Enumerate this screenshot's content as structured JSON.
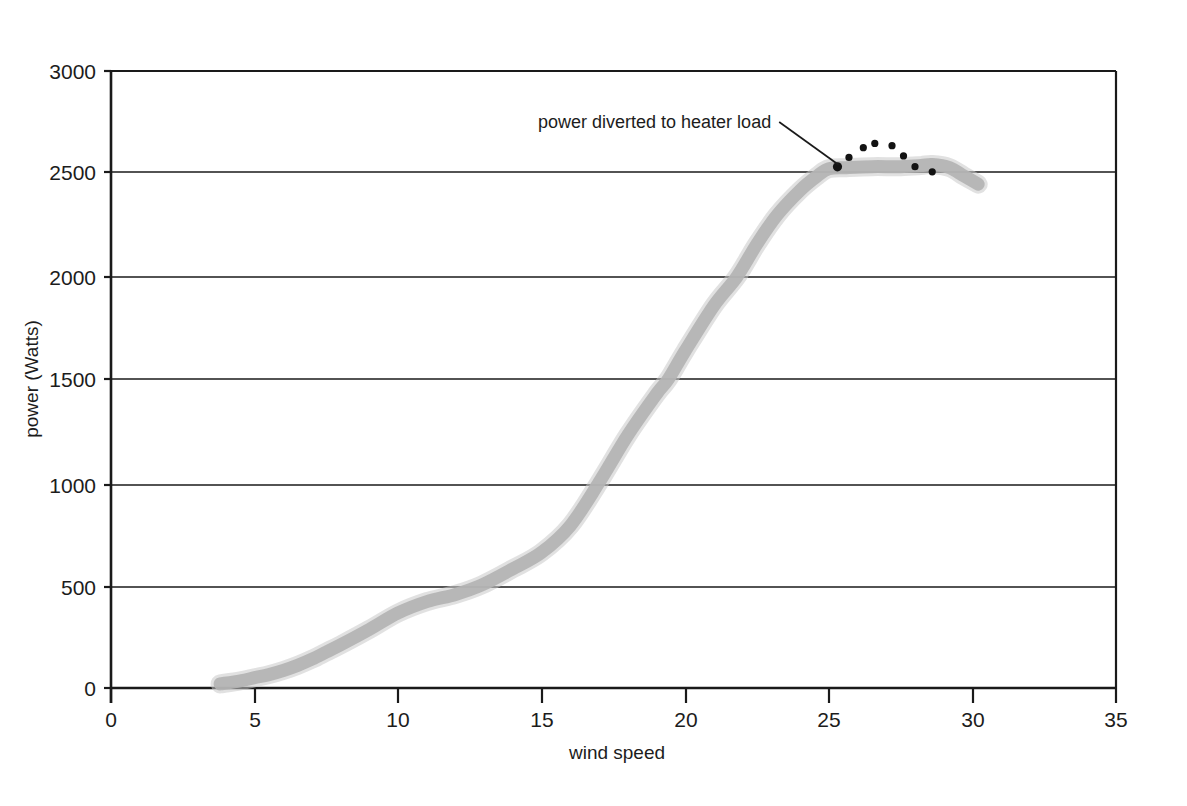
{
  "figure": {
    "background_color": "#ffffff",
    "axis_color": "#1a1a1a",
    "curve_color": "#b3b3b3",
    "dot_color": "#131313"
  },
  "axes": {
    "x_title": "wind speed",
    "y_title": "power (Watts)",
    "x_ticks": [
      "0",
      "5",
      "10",
      "15",
      "20",
      "25",
      "30",
      "35"
    ],
    "y_ticks": [
      "0",
      "500",
      "1000",
      "1500",
      "2000",
      "2500",
      "3000"
    ]
  },
  "annotation": {
    "label": "power diverted to heater load"
  },
  "chart_data": {
    "type": "scatter",
    "title": "",
    "subtitle": "",
    "xlabel": "wind speed",
    "ylabel": "power (Watts)",
    "xlim": [
      0,
      35
    ],
    "ylim": [
      0,
      3000
    ],
    "xticks": [
      0,
      5,
      10,
      15,
      20,
      25,
      30,
      35
    ],
    "yticks": [
      0,
      500,
      1000,
      1500,
      2000,
      2500,
      3000
    ],
    "grid": "horizontal",
    "legend": "none",
    "annotations": [
      {
        "text": "power diverted to heater load",
        "text_x": 16.1,
        "text_y": 2757,
        "points_to_x": 25.3,
        "points_to_y": 2534
      }
    ],
    "series": [
      {
        "name": "turbine power output (grey band)",
        "type": "line",
        "color": "#b3b3b3",
        "x": [
          3.8,
          4.5,
          5.0,
          5.5,
          6.0,
          6.5,
          7.0,
          7.5,
          8.0,
          9.0,
          10.0,
          11.0,
          12.0,
          12.9,
          14.0,
          15.0,
          16.0,
          17.0,
          18.0,
          19.0,
          19.4,
          20.0,
          21.0,
          21.8,
          22.5,
          23.2,
          24.0,
          24.6,
          25.0,
          25.6,
          26.5,
          27.5,
          28.2,
          28.6,
          29.2,
          29.7,
          30.2
        ],
        "y": [
          20,
          35,
          50,
          65,
          85,
          110,
          140,
          175,
          210,
          285,
          365,
          420,
          455,
          500,
          580,
          660,
          790,
          1000,
          1230,
          1430,
          1500,
          1640,
          1860,
          2000,
          2160,
          2300,
          2420,
          2490,
          2525,
          2530,
          2535,
          2535,
          2540,
          2545,
          2530,
          2490,
          2450
        ]
      },
      {
        "name": "power diverted to heater load (dark dots)",
        "type": "scatter",
        "color": "#131313",
        "x": [
          25.3,
          25.7,
          26.2,
          26.6,
          27.2,
          27.6,
          28.0,
          28.6
        ],
        "y": [
          2534,
          2580,
          2627,
          2648,
          2637,
          2587,
          2535,
          2510
        ]
      }
    ]
  }
}
